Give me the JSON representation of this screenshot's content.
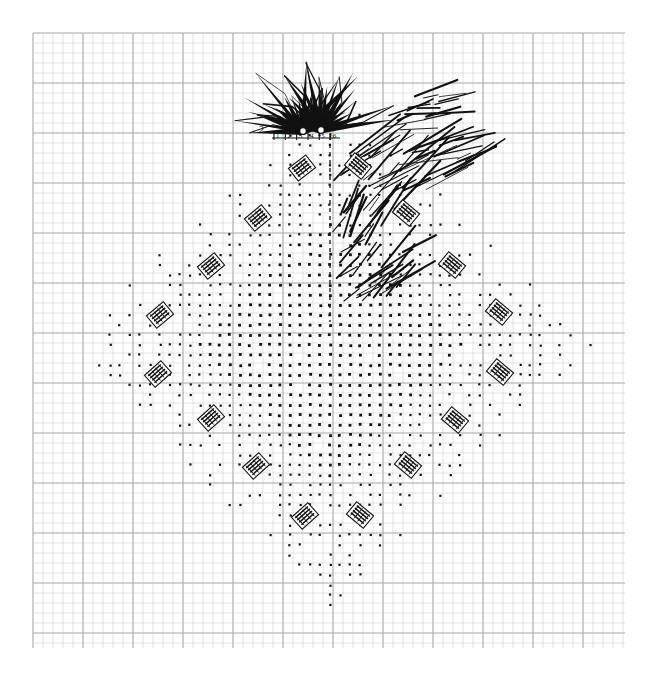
{
  "figure": {
    "caption": "",
    "axis_label": "2",
    "background_color": "#ffffff",
    "ink_color": "#111111"
  },
  "grid": {
    "name": "graph-paper-grid",
    "minor_color": "#d2d2d2",
    "major_color": "#a8a8a8",
    "minor_spacing_px": 10,
    "major_spacing_px": 50,
    "x_start": 33,
    "y_start": 33,
    "x_end": 625,
    "y_end": 648,
    "minor_width": 0.6,
    "major_width": 1.1
  },
  "dot_cloud": {
    "name": "lattice-dot-cloud",
    "shape": "diamond",
    "dot_color": "#111111",
    "center_x": 330,
    "center_y": 345,
    "radius_x": 268,
    "radius_y": 265,
    "lattice_spacing_px": 10,
    "dense_core_radius": 0.52,
    "dot_size_dense": 2.8,
    "dot_size_sparse": 2.2
  },
  "spike_burst": {
    "name": "radial-spike-burst",
    "origin_a_x": 303,
    "origin_a_y": 131,
    "origin_b_x": 321,
    "origin_b_y": 130,
    "marker_radius": 3.4,
    "count": 34,
    "angle_start_deg": 178,
    "angle_end_deg": 352,
    "min_len": 30,
    "max_len": 78,
    "stroke_color": "#111111"
  },
  "scribble_clusters": {
    "name": "hatch-scribble-clusters",
    "stroke_color": "#111111",
    "items": [
      {
        "x": 338,
        "y": 150,
        "w": 72,
        "h": 60,
        "strokes": 26,
        "angle": 38
      },
      {
        "x": 404,
        "y": 140,
        "w": 62,
        "h": 52,
        "strokes": 20,
        "angle": 20
      },
      {
        "x": 336,
        "y": 200,
        "w": 46,
        "h": 46,
        "strokes": 17,
        "angle": 62
      },
      {
        "x": 336,
        "y": 248,
        "w": 66,
        "h": 56,
        "strokes": 24,
        "angle": 40
      },
      {
        "x": 388,
        "y": 96,
        "w": 58,
        "h": 46,
        "strokes": 16,
        "angle": 12
      }
    ]
  },
  "dashed_line": {
    "name": "dashed-axis-line",
    "x": 330,
    "y_top": 136,
    "y_bottom": 322,
    "dash": "4 4",
    "color": "#111111"
  },
  "tick_strip": {
    "name": "origin-tick-strip",
    "x": 272,
    "y": 138,
    "width": 68,
    "marks": [
      "1",
      "2",
      "3",
      "4",
      "5",
      "6"
    ]
  },
  "labels": {
    "name": "rotated-annotation-labels",
    "note": "Small rotated text boxes; glyphs illegible at source resolution",
    "items": [
      {
        "id": "lbl-01",
        "x": 302,
        "y": 168,
        "rot": -38,
        "text": "▤"
      },
      {
        "id": "lbl-02",
        "x": 258,
        "y": 218,
        "rot": -40,
        "text": "▤"
      },
      {
        "id": "lbl-03",
        "x": 211,
        "y": 266,
        "rot": -40,
        "text": "▤"
      },
      {
        "id": "lbl-04",
        "x": 160,
        "y": 315,
        "rot": -40,
        "text": "▤"
      },
      {
        "id": "lbl-05",
        "x": 158,
        "y": 374,
        "rot": -42,
        "text": "▤"
      },
      {
        "id": "lbl-06",
        "x": 211,
        "y": 418,
        "rot": -42,
        "text": "▤"
      },
      {
        "id": "lbl-07",
        "x": 256,
        "y": 466,
        "rot": -42,
        "text": "▤"
      },
      {
        "id": "lbl-08",
        "x": 305,
        "y": 516,
        "rot": -42,
        "text": "▤"
      },
      {
        "id": "lbl-09",
        "x": 360,
        "y": 515,
        "rot": 40,
        "text": "▤"
      },
      {
        "id": "lbl-10",
        "x": 408,
        "y": 465,
        "rot": 40,
        "text": "▤"
      },
      {
        "id": "lbl-11",
        "x": 455,
        "y": 420,
        "rot": 40,
        "text": "▤"
      },
      {
        "id": "lbl-12",
        "x": 500,
        "y": 372,
        "rot": 40,
        "text": "▤"
      },
      {
        "id": "lbl-13",
        "x": 499,
        "y": 312,
        "rot": 40,
        "text": "▤"
      },
      {
        "id": "lbl-14",
        "x": 452,
        "y": 265,
        "rot": 40,
        "text": "▤"
      },
      {
        "id": "lbl-15",
        "x": 406,
        "y": 213,
        "rot": 40,
        "text": "▤"
      },
      {
        "id": "lbl-16",
        "x": 358,
        "y": 166,
        "rot": 40,
        "text": "▤"
      }
    ]
  }
}
